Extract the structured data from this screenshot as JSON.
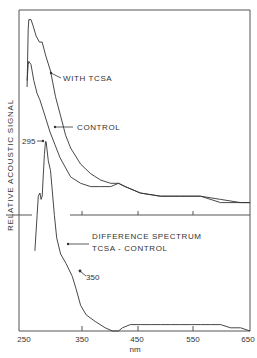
{
  "chart_data": {
    "type": "line",
    "title": "",
    "xlabel": "nm",
    "ylabel": "RELATIVE ACOUSTIC SIGNAL",
    "xlim": [
      250,
      650
    ],
    "x_ticks": [
      "250",
      "350",
      "450",
      "550",
      "650"
    ],
    "grid": false,
    "legend": "inline annotations",
    "annotations": {
      "with_tcsa": "WITH TCSA",
      "control": "CONTROL",
      "peak_295": "295",
      "diff_line1": "DIFFERENCE SPECTRUM",
      "diff_line2": "TCSA - CONTROL",
      "point_350": "350"
    },
    "series": [
      {
        "name": "WITH TCSA",
        "panel": "upper",
        "points": [
          [
            252,
            76
          ],
          [
            254,
            94
          ],
          [
            255,
            97
          ],
          [
            259,
            97
          ],
          [
            263,
            95
          ],
          [
            268,
            92
          ],
          [
            274,
            90
          ],
          [
            279,
            90
          ],
          [
            285,
            86
          ],
          [
            294,
            81
          ],
          [
            303,
            73
          ],
          [
            312,
            67
          ],
          [
            321,
            61
          ],
          [
            330,
            57
          ],
          [
            348,
            52
          ],
          [
            366,
            49
          ],
          [
            384,
            47
          ],
          [
            402,
            46
          ],
          [
            416,
            46
          ],
          [
            428,
            45
          ],
          [
            455,
            43
          ],
          [
            491,
            42
          ],
          [
            527,
            42
          ],
          [
            563,
            42
          ],
          [
            599,
            41
          ],
          [
            635,
            40
          ],
          [
            652,
            40
          ]
        ]
      },
      {
        "name": "CONTROL",
        "panel": "upper",
        "points": [
          [
            252,
            78
          ],
          [
            254,
            83
          ],
          [
            255,
            84
          ],
          [
            259,
            83
          ],
          [
            264,
            78
          ],
          [
            270,
            74
          ],
          [
            275,
            72
          ],
          [
            284,
            67
          ],
          [
            293,
            62
          ],
          [
            302,
            58
          ],
          [
            311,
            54
          ],
          [
            330,
            48
          ],
          [
            348,
            46
          ],
          [
            366,
            45
          ],
          [
            384,
            45
          ],
          [
            402,
            45
          ],
          [
            416,
            46
          ],
          [
            428,
            45
          ],
          [
            455,
            43
          ],
          [
            491,
            42
          ],
          [
            527,
            42
          ],
          [
            563,
            42
          ],
          [
            599,
            40
          ],
          [
            635,
            40
          ],
          [
            652,
            40
          ]
        ]
      },
      {
        "name": "DIFFERENCE SPECTRUM (TCSA - CONTROL)",
        "panel": "lower",
        "points": [
          [
            266,
            25
          ],
          [
            270,
            36
          ],
          [
            272,
            42
          ],
          [
            275,
            43
          ],
          [
            277,
            41
          ],
          [
            279,
            42
          ],
          [
            283,
            55
          ],
          [
            285,
            59
          ],
          [
            286,
            59
          ],
          [
            290,
            53
          ],
          [
            294,
            50
          ],
          [
            297,
            44
          ],
          [
            301,
            36
          ],
          [
            305,
            29
          ],
          [
            312,
            24
          ],
          [
            322,
            21
          ],
          [
            333,
            17
          ],
          [
            340,
            13
          ],
          [
            348,
            8
          ],
          [
            358,
            5
          ],
          [
            374,
            3
          ],
          [
            392,
            1
          ],
          [
            405,
            0
          ],
          [
            416,
            0
          ],
          [
            423,
            1
          ],
          [
            437,
            2
          ],
          [
            455,
            2
          ],
          [
            473,
            2
          ],
          [
            491,
            2
          ],
          [
            509,
            2
          ],
          [
            527,
            2
          ],
          [
            545,
            2
          ],
          [
            563,
            2
          ],
          [
            581,
            2
          ],
          [
            599,
            2
          ],
          [
            617,
            1
          ],
          [
            635,
            1
          ],
          [
            652,
            0
          ]
        ]
      }
    ]
  }
}
